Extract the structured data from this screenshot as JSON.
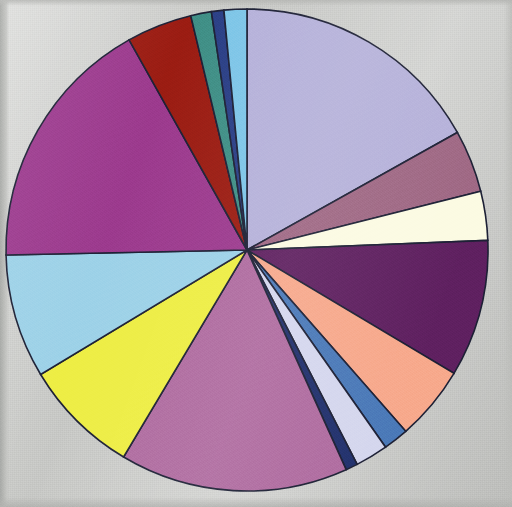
{
  "figure": {
    "type": "pie-chart-scan",
    "background_color": "#cacbc8",
    "outline_color": "#1d2035",
    "width": 512,
    "height": 507
  },
  "chart_data": {
    "type": "pie",
    "title": "",
    "subtitle": "",
    "xlabel": "",
    "ylabel": "",
    "legend_position": "none",
    "grid": false,
    "labels_shown": false,
    "start_angle_deg": 0,
    "direction": "clockwise",
    "center": {
      "x": 247,
      "y": 250
    },
    "radius": 241,
    "total": 100,
    "categories": [
      "Slice 1",
      "Slice 2",
      "Slice 3",
      "Slice 4",
      "Slice 5",
      "Slice 6",
      "Slice 7",
      "Slice 8",
      "Slice 9",
      "Slice 10",
      "Slice 11",
      "Slice 12",
      "Slice 13",
      "Slice 14",
      "Slice 15",
      "Slice 16"
    ],
    "values": [
      16.9,
      4.2,
      3.3,
      9.2,
      5.0,
      1.7,
      2.2,
      0.8,
      15.3,
      7.8,
      8.3,
      17.2,
      4.4,
      1.4,
      0.8,
      1.5
    ],
    "colors": [
      "#b6b2da",
      "#9f6884",
      "#fcfbe3",
      "#5f2060",
      "#f7a98c",
      "#4a79b8",
      "#d5d7ee",
      "#21306c",
      "#b06ca0",
      "#eeee44",
      "#9dd2e8",
      "#9c3a8e",
      "#9b1c12",
      "#3f8f86",
      "#2a3f86",
      "#7ec6e8"
    ],
    "slices": [
      {
        "label": "Slice 1",
        "value": 16.9,
        "color": "#b6b2da",
        "start_deg": 0.0,
        "end_deg": 60.8,
        "color_name": "light-periwinkle"
      },
      {
        "label": "Slice 2",
        "value": 4.2,
        "color": "#9f6884",
        "start_deg": 60.8,
        "end_deg": 75.9,
        "color_name": "rosy-mauve"
      },
      {
        "label": "Slice 3",
        "value": 3.3,
        "color": "#fcfbe3",
        "start_deg": 75.9,
        "end_deg": 87.7,
        "color_name": "cream-ivory"
      },
      {
        "label": "Slice 4",
        "value": 9.2,
        "color": "#5f2060",
        "start_deg": 87.7,
        "end_deg": 120.8,
        "color_name": "dark-purple"
      },
      {
        "label": "Slice 5",
        "value": 5.0,
        "color": "#f7a98c",
        "start_deg": 120.8,
        "end_deg": 138.8,
        "color_name": "salmon-peach"
      },
      {
        "label": "Slice 6",
        "value": 1.7,
        "color": "#4a79b8",
        "start_deg": 138.8,
        "end_deg": 144.9,
        "color_name": "steel-blue"
      },
      {
        "label": "Slice 7",
        "value": 2.2,
        "color": "#d5d7ee",
        "start_deg": 144.9,
        "end_deg": 152.8,
        "color_name": "pale-lavender"
      },
      {
        "label": "Slice 8",
        "value": 0.8,
        "color": "#21306c",
        "start_deg": 152.8,
        "end_deg": 155.7,
        "color_name": "navy-blue"
      },
      {
        "label": "Slice 9",
        "value": 15.3,
        "color": "#b06ca0",
        "start_deg": 155.7,
        "end_deg": 210.8,
        "color_name": "orchid-pink"
      },
      {
        "label": "Slice 10",
        "value": 7.8,
        "color": "#eeee44",
        "start_deg": 210.8,
        "end_deg": 238.9,
        "color_name": "yellow"
      },
      {
        "label": "Slice 11",
        "value": 8.3,
        "color": "#9dd2e8",
        "start_deg": 238.9,
        "end_deg": 268.8,
        "color_name": "light-sky-blue"
      },
      {
        "label": "Slice 12",
        "value": 17.2,
        "color": "#9c3a8e",
        "start_deg": 268.8,
        "end_deg": 330.7,
        "color_name": "magenta-purple"
      },
      {
        "label": "Slice 13",
        "value": 4.4,
        "color": "#9b1c12",
        "start_deg": 330.7,
        "end_deg": 346.5,
        "color_name": "dark-red"
      },
      {
        "label": "Slice 14",
        "value": 1.4,
        "color": "#3f8f86",
        "start_deg": 346.5,
        "end_deg": 351.5,
        "color_name": "teal-green"
      },
      {
        "label": "Slice 15",
        "value": 0.8,
        "color": "#2a3f86",
        "start_deg": 351.5,
        "end_deg": 354.5,
        "color_name": "dark-navy"
      },
      {
        "label": "Slice 16",
        "value": 1.5,
        "color": "#7ec6e8",
        "start_deg": 354.5,
        "end_deg": 360.0,
        "color_name": "sky-blue"
      }
    ]
  }
}
